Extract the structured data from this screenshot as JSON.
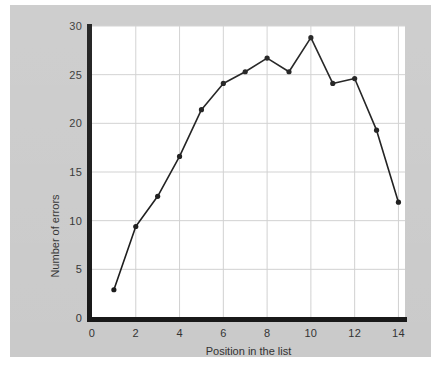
{
  "figure": {
    "background_color": "#c9c9c9",
    "plot_background_color": "#ffffff",
    "axis_color": "#121212",
    "grid_color": "#cfcfcf",
    "series_color": "#141414"
  },
  "chart_data": {
    "type": "line",
    "title": "",
    "xlabel": "Position in the list",
    "ylabel": "Number of errors",
    "x": [
      1,
      2,
      3,
      4,
      5,
      6,
      7,
      8,
      9,
      10,
      11,
      12,
      13,
      14
    ],
    "values": [
      2.9,
      9.4,
      12.5,
      16.6,
      21.4,
      24.1,
      25.3,
      26.7,
      25.3,
      28.8,
      24.1,
      24.6,
      19.3,
      11.9
    ],
    "series": [
      {
        "name": "Number of errors",
        "values": [
          2.9,
          9.4,
          12.5,
          16.6,
          21.4,
          24.1,
          25.3,
          26.7,
          25.3,
          28.8,
          24.1,
          24.6,
          19.3,
          11.9
        ]
      }
    ],
    "xlim": [
      0,
      14.3
    ],
    "ylim": [
      0,
      30
    ],
    "xticks": [
      0,
      2,
      4,
      6,
      8,
      10,
      12,
      14
    ],
    "xticklabels": [
      "0",
      "2",
      "4",
      "6",
      "8",
      "10",
      "12",
      "14"
    ],
    "yticks": [
      0,
      5,
      10,
      15,
      20,
      25,
      30
    ],
    "yticklabels": [
      "0",
      "5",
      "10",
      "15",
      "20",
      "25",
      "30"
    ],
    "grid": true,
    "grid_axes": "both",
    "legend": false,
    "marker": "circle",
    "linewidth": 1.6
  }
}
